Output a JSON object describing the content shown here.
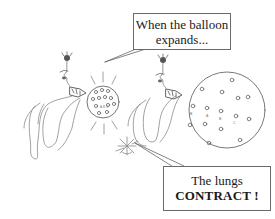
{
  "figure": {
    "panels": [
      {
        "name": "left",
        "balloon_state": "small",
        "balloon_labels": [
          "A",
          "B",
          "C"
        ]
      },
      {
        "name": "right",
        "balloon_state": "expanded",
        "balloon_labels": [
          "B",
          "A",
          "B",
          "C"
        ]
      }
    ]
  },
  "callouts": {
    "top": {
      "line1": "When the balloon",
      "line2": "expands..."
    },
    "bottom": {
      "line1": "The lungs",
      "line2": "CONTRACT !"
    }
  },
  "colors": {
    "stroke": "#555555",
    "light_stroke": "#9a9a9a",
    "background": "#ffffff"
  }
}
